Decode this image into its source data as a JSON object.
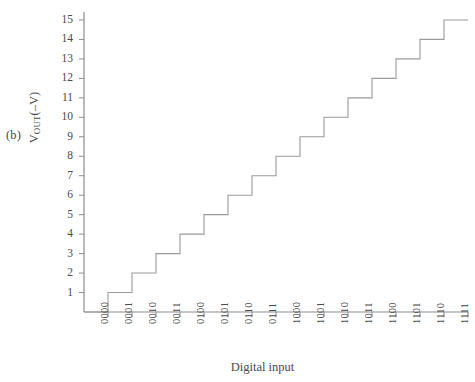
{
  "figure": {
    "panel_label": "(b)",
    "y_axis_label_main": "V",
    "y_axis_label_sub": "OUT",
    "y_axis_label_unit": "(–V)",
    "x_axis_label": "Digital input",
    "line_color": "#9a9a9a",
    "axis_color": "#8c8c8c",
    "text_color": "#4a4a4a",
    "background": "#ffffff"
  },
  "chart_data": {
    "type": "line",
    "title": "",
    "subtitle": "",
    "xlabel": "Digital input",
    "ylabel": "VOUT(–V)",
    "step_style": "staircase",
    "grid": false,
    "legend": null,
    "categories": [
      "0000",
      "0001",
      "0010",
      "0011",
      "0100",
      "0101",
      "0110",
      "0111",
      "1000",
      "1001",
      "1010",
      "1011",
      "1100",
      "1101",
      "1110",
      "1111"
    ],
    "values": [
      0,
      1,
      2,
      3,
      4,
      5,
      6,
      7,
      8,
      9,
      10,
      11,
      12,
      13,
      14,
      15
    ],
    "ylim": [
      0,
      15
    ],
    "ytick_labels": [
      "1",
      "2",
      "3",
      "4",
      "5",
      "6",
      "7",
      "8",
      "9",
      "10",
      "11",
      "12",
      "13",
      "14",
      "15"
    ],
    "ytick_values": [
      1,
      2,
      3,
      4,
      5,
      6,
      7,
      8,
      9,
      10,
      11,
      12,
      13,
      14,
      15
    ],
    "xtick_labels": [
      "0000",
      "0001",
      "0010",
      "0011",
      "0100",
      "0101",
      "0110",
      "0111",
      "1000",
      "1001",
      "1010",
      "1011",
      "1100",
      "1101",
      "1110",
      "1111"
    ]
  }
}
